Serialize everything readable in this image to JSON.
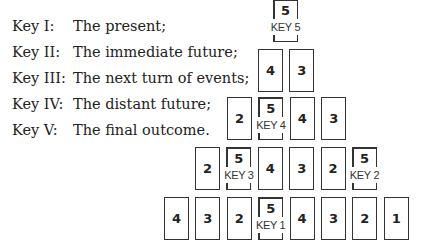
{
  "legend": [
    {
      "key": "Key I:",
      "desc": "The present;"
    },
    {
      "key": "Key II:",
      "desc": "The immediate future;"
    },
    {
      "key": "Key III:",
      "desc": "The next turn of events;"
    },
    {
      "key": "Key IV:",
      "desc": "The distant future;"
    },
    {
      "key": "Key V:",
      "desc": "The final outcome."
    }
  ],
  "pyramid": {
    "rows": [
      {
        "cards": [
          {
            "num": "5",
            "key": "KEY 5"
          }
        ]
      },
      {
        "cards": [
          {
            "num": "4"
          },
          {
            "num": "3"
          }
        ]
      },
      {
        "cards": [
          {
            "num": "2"
          },
          {
            "num": "5",
            "key": "KEY 4"
          },
          {
            "num": "4"
          },
          {
            "num": "3"
          }
        ]
      },
      {
        "cards": [
          {
            "num": "2"
          },
          {
            "num": "5",
            "key": "KEY 3"
          },
          {
            "num": "4"
          },
          {
            "num": "3"
          },
          {
            "num": "2"
          },
          {
            "num": "5",
            "key": "KEY 2"
          }
        ]
      },
      {
        "cards": [
          {
            "num": "4"
          },
          {
            "num": "3"
          },
          {
            "num": "2"
          },
          {
            "num": "5",
            "key": "KEY 1"
          },
          {
            "num": "4"
          },
          {
            "num": "3"
          },
          {
            "num": "2"
          },
          {
            "num": "1"
          }
        ]
      }
    ]
  }
}
